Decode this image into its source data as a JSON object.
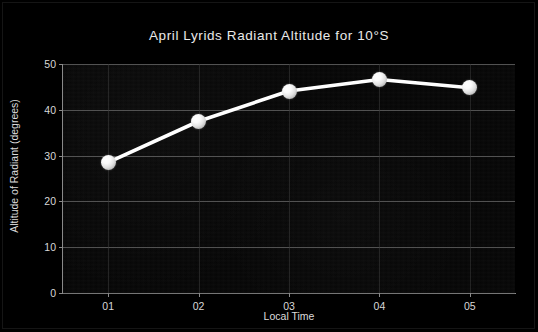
{
  "chart_data": {
    "type": "line",
    "title": "April Lyrids Radiant Altitude for 10°S",
    "xlabel": "Local Time",
    "ylabel": "Altitude of Radiant (degrees)",
    "categories": [
      "01",
      "02",
      "03",
      "04",
      "05"
    ],
    "values": [
      28.5,
      37.5,
      44.1,
      46.6,
      44.8
    ],
    "series": [
      {
        "name": "Radiant Altitude",
        "values": [
          28.5,
          37.5,
          44.1,
          46.6,
          44.8
        ]
      }
    ],
    "x_tick_labels": [
      "01",
      "02",
      "03",
      "04",
      "05"
    ],
    "y_tick_labels": [
      "0",
      "10",
      "20",
      "30",
      "40",
      "50"
    ],
    "y_ticks": [
      0,
      10,
      20,
      30,
      40,
      50
    ],
    "ylim": [
      0,
      50
    ],
    "xlim": [
      0.5,
      5.5
    ],
    "grid": "horizontal-and-vertical",
    "legend": "none",
    "marker": "sphere",
    "line_color": "#ffffff",
    "marker_color": "#f2f2f2",
    "grid_color": "#6d6d6d",
    "background_color": "#000000",
    "text_color": "#e3e3e3"
  },
  "figure": {
    "title": "April Lyrids Radiant Altitude for 10°S",
    "x_axis_label": "Local Time",
    "y_axis_label": "Altitude of Radiant (degrees)"
  }
}
